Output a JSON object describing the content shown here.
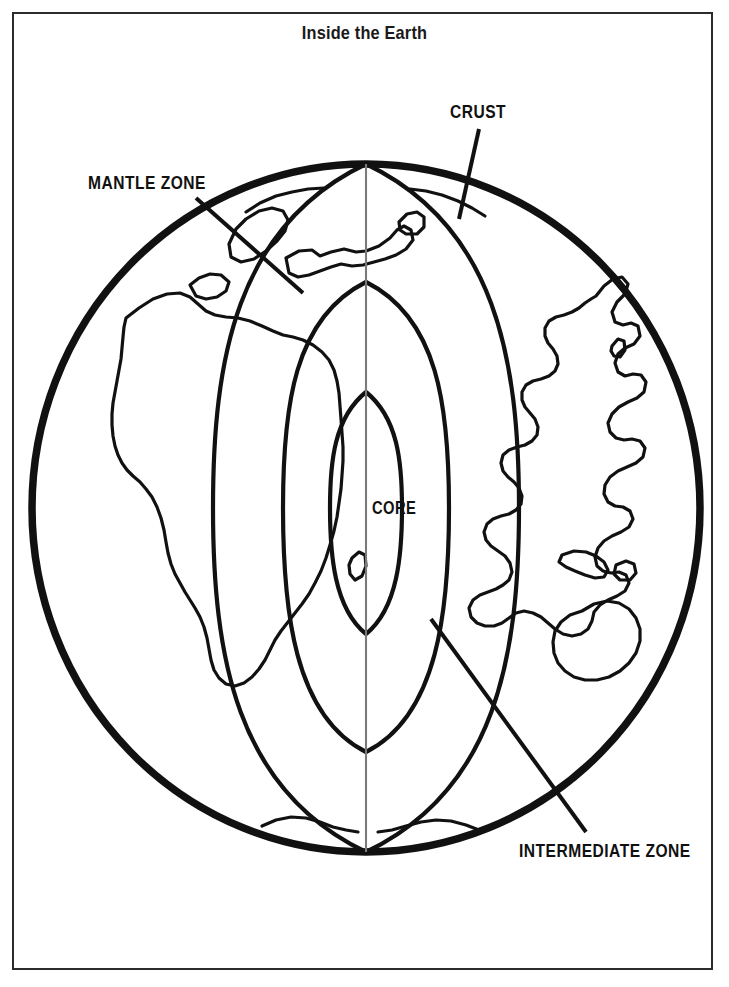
{
  "document": {
    "title": "Inside the Earth",
    "page_number": ""
  },
  "labels": {
    "crust": "CRUST",
    "mantle_zone": "MANTLE ZONE",
    "intermediate_zone": "INTERMEDIATE ZONE",
    "core": "CORE"
  },
  "colors": {
    "ink": "#111111",
    "frame": "#2b2b2b",
    "paper": "#ffffff",
    "axis_line": "#6f6f6f"
  },
  "diagram": {
    "type": "cutaway-cross-section",
    "globe": {
      "center_x": 366,
      "center_y": 508,
      "radius_x": 334,
      "radius_y": 344,
      "outline_width": 7
    },
    "layers": [
      {
        "name": "crust",
        "half_width": 0
      },
      {
        "name": "mantle zone",
        "half_width": 153
      },
      {
        "name": "intermediate zone",
        "half_width": 84
      },
      {
        "name": "core",
        "half_width": 37
      }
    ],
    "leader_lines": [
      {
        "label": "mantle-zone",
        "x1": 198,
        "y1": 200,
        "x2": 302,
        "y2": 292
      },
      {
        "label": "crust",
        "x1": 478,
        "y1": 130,
        "x2": 460,
        "y2": 218
      },
      {
        "label": "intermediate-zone",
        "x1": 585,
        "y1": 831,
        "x2": 432,
        "y2": 620
      }
    ]
  }
}
